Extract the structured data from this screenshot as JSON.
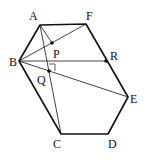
{
  "diagram": {
    "points": [
      {
        "name": "A",
        "label": "A"
      },
      {
        "name": "B",
        "label": "B"
      },
      {
        "name": "C",
        "label": "C"
      },
      {
        "name": "D",
        "label": "D"
      },
      {
        "name": "E",
        "label": "E"
      },
      {
        "name": "F",
        "label": "F"
      },
      {
        "name": "P",
        "label": "P"
      },
      {
        "name": "Q",
        "label": "Q"
      },
      {
        "name": "R",
        "label": "R"
      }
    ],
    "polygon": [
      "A",
      "F",
      "E",
      "D",
      "C",
      "B"
    ],
    "segments": [
      [
        "B",
        "F"
      ],
      [
        "A",
        "C"
      ],
      [
        "A",
        "P"
      ],
      [
        "B",
        "R"
      ],
      [
        "B",
        "E"
      ]
    ],
    "dots": [
      "P",
      "Q",
      "R"
    ],
    "right_angle_at": "Q",
    "colors": {
      "stroke": "#111111",
      "background": "#ffffff"
    }
  }
}
